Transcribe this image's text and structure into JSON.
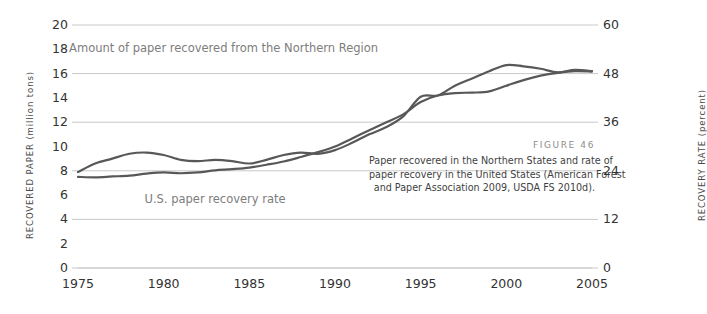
{
  "figure": {
    "label": "FIGURE 46",
    "caption_lines": [
      "Paper recovered in the Northern States and rate of",
      "paper recovery in the United States (American Forest",
      "and Paper Association 2009, USDA FS 2010d)."
    ]
  },
  "colors": {
    "line": "#585858",
    "grid": "#c9c9c9",
    "axis_text": "#333333",
    "annotation_text": "#7d7d7d",
    "axis_title": "#4a4a4a",
    "caption_label": "#8d8d8d",
    "caption_text": "#3f3f3f",
    "background": "#ffffff"
  },
  "chart_data": {
    "type": "line",
    "title": "",
    "xlabel": "",
    "ylabel": "RECOVERED PAPER (million tons)",
    "y2label": "RECOVERY RATE (percent)",
    "xlim": [
      1975,
      2005
    ],
    "ylim": [
      0,
      20
    ],
    "y2lim": [
      0,
      60
    ],
    "grid": true,
    "legend": "annotations-inline",
    "xticks": [
      1975,
      1980,
      1985,
      1990,
      1995,
      2000,
      2005
    ],
    "xtick_labels": [
      "1975",
      "1980",
      "1985",
      "1990",
      "1995",
      "2000",
      "2005"
    ],
    "yticks": [
      0,
      2,
      4,
      6,
      8,
      10,
      12,
      14,
      16,
      18,
      20
    ],
    "ytick_labels": [
      "0",
      "2",
      "4",
      "6",
      "8",
      "10",
      "12",
      "14",
      "16",
      "18",
      "20"
    ],
    "y2ticks": [
      0,
      12,
      24,
      36,
      48,
      60
    ],
    "y2tick_labels": [
      "0",
      "12",
      "24",
      "36",
      "48",
      "60"
    ],
    "gridlines_y": [
      0,
      4,
      8,
      12,
      16,
      20
    ],
    "annotations": [
      {
        "text": "Amount of paper recovered from the Northern Region",
        "x": 1983.5,
        "y": 18.0,
        "series": "recovered_paper"
      },
      {
        "text": "U.S. paper recovery rate",
        "x": 1983.0,
        "y": 5.6,
        "series": "recovery_rate"
      }
    ],
    "x": [
      1975,
      1976,
      1977,
      1978,
      1979,
      1980,
      1981,
      1982,
      1983,
      1984,
      1985,
      1986,
      1987,
      1988,
      1989,
      1990,
      1991,
      1992,
      1993,
      1994,
      1995,
      1996,
      1997,
      1998,
      1999,
      2000,
      2001,
      2002,
      2003,
      2004,
      2005
    ],
    "series": [
      {
        "name": "Amount of paper recovered from the Northern Region",
        "axis": "left",
        "units": "million tons",
        "values": [
          7.9,
          8.6,
          9.0,
          9.4,
          9.5,
          9.3,
          8.9,
          8.8,
          8.9,
          8.8,
          8.6,
          8.9,
          9.3,
          9.5,
          9.4,
          9.7,
          10.3,
          11.0,
          11.6,
          12.5,
          14.1,
          14.2,
          15.0,
          15.6,
          16.2,
          16.7,
          16.6,
          16.4,
          16.1,
          16.3,
          16.2
        ]
      },
      {
        "name": "U.S. paper recovery rate",
        "axis": "right",
        "units": "percent",
        "values": [
          22.5,
          22.4,
          22.6,
          22.8,
          23.3,
          23.6,
          23.4,
          23.6,
          24.1,
          24.4,
          24.8,
          25.5,
          26.3,
          27.4,
          28.6,
          30.0,
          32.0,
          34.0,
          36.0,
          38.0,
          41.0,
          42.6,
          43.2,
          43.3,
          43.6,
          45.0,
          46.4,
          47.5,
          48.2,
          48.6,
          48.5
        ]
      }
    ]
  }
}
